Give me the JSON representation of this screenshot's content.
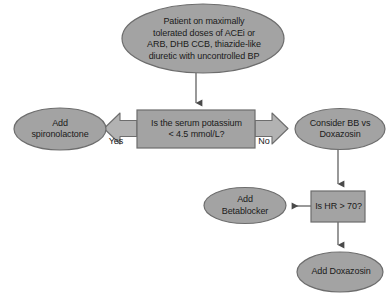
{
  "diagram": {
    "type": "flowchart",
    "colors": {
      "node_fill": "#a3a3a3",
      "node_stroke": "#6d6d6d",
      "arrow_fill": "#b0b0b0",
      "arrow_stroke": "#6d6d6d",
      "connector": "#6d6d6d",
      "text": "#1a1a1a",
      "background": "#ffffff"
    },
    "nodes": [
      {
        "id": "start",
        "shape": "ellipse",
        "label": "Patient on maximally\ntolerated doses of ACEi or\nARB, DHB CCB, thiazide-like\ndiuretic with uncontrolled BP"
      },
      {
        "id": "potassium",
        "shape": "rectangle",
        "label": "Is the serum potassium\n< 4.5 mmol/L?"
      },
      {
        "id": "spironolactone",
        "shape": "ellipse",
        "label": "Add\nspironolactone"
      },
      {
        "id": "bb-vs-doxazosin",
        "shape": "ellipse",
        "label": "Consider BB vs\nDoxazosin"
      },
      {
        "id": "heart-rate",
        "shape": "rectangle",
        "label": "Is HR > 70?"
      },
      {
        "id": "betablocker",
        "shape": "ellipse",
        "label": "Add\nBetablocker"
      },
      {
        "id": "doxazosin",
        "shape": "ellipse",
        "label": "Add Doxazosin"
      }
    ],
    "edges": [
      {
        "id": "start-to-potassium",
        "from": "start",
        "to": "potassium",
        "label": "",
        "style": "line-arrow"
      },
      {
        "id": "potassium-yes",
        "from": "potassium",
        "to": "spironolactone",
        "label": "Yes",
        "style": "block-arrow"
      },
      {
        "id": "potassium-no",
        "from": "potassium",
        "to": "bb-vs-doxazosin",
        "label": "No",
        "style": "block-arrow"
      },
      {
        "id": "bb-to-hr",
        "from": "bb-vs-doxazosin",
        "to": "heart-rate",
        "label": "",
        "style": "line-arrow"
      },
      {
        "id": "hr-to-betablocker",
        "from": "heart-rate",
        "to": "betablocker",
        "label": "",
        "style": "line-arrow"
      },
      {
        "id": "hr-to-doxazosin",
        "from": "heart-rate",
        "to": "doxazosin",
        "label": "",
        "style": "line-arrow"
      }
    ]
  }
}
